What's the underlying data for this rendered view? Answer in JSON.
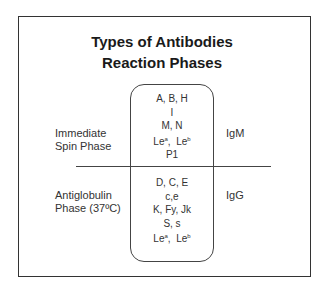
{
  "title": {
    "line1": "Types of Antibodies",
    "line2": "Reaction Phases"
  },
  "phases": [
    {
      "label_line1": "Immediate",
      "label_line2": "Spin Phase",
      "antibody_class": "IgM",
      "antigens": [
        "A, B, H",
        "I",
        "M, N",
        "Le^a, Le^b",
        "P1"
      ],
      "lewis": {
        "a_base": "Le",
        "a_sup": "a",
        "sep": ",  ",
        "b_base": "Le",
        "b_sup": "b"
      }
    },
    {
      "label_line1": "Antiglobulin",
      "label_line2": "Phase (37ºC)",
      "antibody_class": "IgG",
      "antigens": [
        "D, C, E",
        "c,e",
        "K, Fy, Jk",
        "S, s",
        "Le^a, Le^b"
      ],
      "lewis": {
        "a_base": "Le",
        "a_sup": "a",
        "sep": ",  ",
        "b_base": "Le",
        "b_sup": "b"
      }
    }
  ]
}
